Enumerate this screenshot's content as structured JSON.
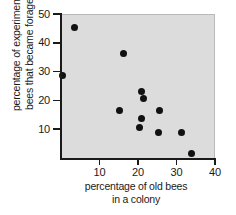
{
  "chart_data": {
    "type": "scatter",
    "title": "",
    "xlabel": "percentage of old bees in a colony",
    "xlabel_lines": [
      "percentage of old bees",
      "in a colony"
    ],
    "ylabel": "percentage of experimental bees that became foragers",
    "ylabel_lines": [
      "percentage of experimental",
      "bees that became foragers"
    ],
    "xlim": [
      0,
      40
    ],
    "ylim": [
      0,
      50
    ],
    "xticks": [
      10,
      20,
      30,
      40
    ],
    "yticks": [
      10,
      20,
      30,
      40,
      50
    ],
    "xtick_labels": [
      "10",
      "20",
      "30",
      "40"
    ],
    "ytick_labels": [
      "10",
      "20",
      "30",
      "40",
      "50"
    ],
    "grid": false,
    "legend": null,
    "plot_background_color": "#dcdcdc",
    "point_color": "#111111",
    "axis_color": "#1a1a1a",
    "points": [
      {
        "x": 3.5,
        "y": 45.5
      },
      {
        "x": 0.5,
        "y": 29.0
      },
      {
        "x": 16.2,
        "y": 36.5
      },
      {
        "x": 15.2,
        "y": 17.0
      },
      {
        "x": 21.0,
        "y": 23.5
      },
      {
        "x": 21.3,
        "y": 21.0
      },
      {
        "x": 21.0,
        "y": 14.0
      },
      {
        "x": 20.3,
        "y": 10.8
      },
      {
        "x": 25.6,
        "y": 17.0
      },
      {
        "x": 25.4,
        "y": 9.3
      },
      {
        "x": 31.3,
        "y": 9.3
      },
      {
        "x": 33.8,
        "y": 1.8
      }
    ]
  }
}
